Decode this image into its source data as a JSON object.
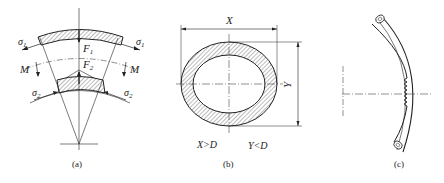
{
  "figure": {
    "panels": [
      {
        "id": "a",
        "caption": "(a)",
        "labels": {
          "sigma1_left": "σ",
          "sigma1_sub": "1",
          "sigma2_left": "σ",
          "sigma2_sub": "2",
          "F1": "F",
          "F1_sub": "1",
          "F2": "F",
          "F2_sub": "2",
          "M_left": "M",
          "M_right": "M"
        }
      },
      {
        "id": "b",
        "caption": "(b)",
        "labels": {
          "X": "X",
          "Y": "Y",
          "cond_x": "X>D",
          "cond_y": "Y<D"
        }
      },
      {
        "id": "c",
        "caption": "(c)"
      }
    ],
    "colors": {
      "line": "#222222",
      "hatch": "#555555",
      "background": "#ffffff"
    }
  }
}
